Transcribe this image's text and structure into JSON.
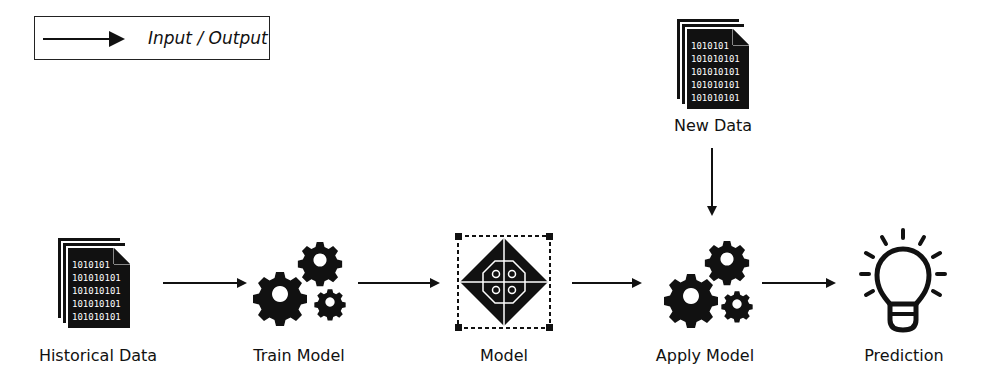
{
  "legend": {
    "label": "Input / Output",
    "icon": "arrow-right-icon"
  },
  "nodes": [
    {
      "id": "historical-data",
      "label": "Historical Data",
      "icon": "binary-document-stack-icon",
      "binary_lines": [
        "1010101",
        "101010101",
        "101010101",
        "101010101",
        "101010101"
      ]
    },
    {
      "id": "train-model",
      "label": "Train Model",
      "icon": "gears-icon"
    },
    {
      "id": "model",
      "label": "Model",
      "icon": "model-diamond-icon"
    },
    {
      "id": "new-data",
      "label": "New Data",
      "icon": "binary-document-stack-icon",
      "binary_lines": [
        "1010101",
        "101010101",
        "101010101",
        "101010101",
        "101010101"
      ]
    },
    {
      "id": "apply-model",
      "label": "Apply Model",
      "icon": "gears-icon"
    },
    {
      "id": "prediction",
      "label": "Prediction",
      "icon": "lightbulb-icon"
    }
  ],
  "edges": [
    {
      "from": "historical-data",
      "to": "train-model"
    },
    {
      "from": "train-model",
      "to": "model"
    },
    {
      "from": "model",
      "to": "apply-model"
    },
    {
      "from": "new-data",
      "to": "apply-model"
    },
    {
      "from": "apply-model",
      "to": "prediction"
    }
  ],
  "colors": {
    "ink": "#111111",
    "background": "#ffffff"
  }
}
